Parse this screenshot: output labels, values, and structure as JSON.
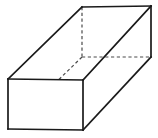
{
  "figure": {
    "name": "rectangular-prism",
    "background_color": "#ffffff",
    "solid_edge_color": "#1a1a1a",
    "hidden_edge_color": "#4a4a4a",
    "solid_edge_width": 1.7,
    "hidden_edge_width": 1.2,
    "hidden_dash_pattern": "3.2 2.6",
    "labels": [],
    "vertices": {
      "front_top_left": [
        8,
        79
      ],
      "front_top_right": [
        83,
        80
      ],
      "front_bottom_right": [
        83,
        130
      ],
      "front_bottom_left": [
        8,
        129
      ],
      "back_top_left": [
        82,
        7
      ],
      "back_top_right": [
        151,
        6
      ],
      "back_bottom_right": [
        151,
        57
      ],
      "back_bottom_left": [
        82,
        57
      ]
    },
    "faces": {
      "front": "8,79 83,80 83,130 8,129",
      "top": "8,79 82,7 151,6 83,80",
      "right": "83,80 151,6 151,57 83,130"
    },
    "edges_solid": [
      {
        "name": "front-top-edge",
        "from": [
          8,
          79
        ],
        "to": [
          83,
          80
        ]
      },
      {
        "name": "front-right-edge",
        "from": [
          83,
          80
        ],
        "to": [
          83,
          130
        ]
      },
      {
        "name": "front-bottom-edge",
        "from": [
          83,
          130
        ],
        "to": [
          8,
          129
        ]
      },
      {
        "name": "front-left-edge",
        "from": [
          8,
          129
        ],
        "to": [
          8,
          79
        ]
      },
      {
        "name": "top-left-receding-edge",
        "from": [
          8,
          79
        ],
        "to": [
          82,
          7
        ]
      },
      {
        "name": "top-back-edge",
        "from": [
          82,
          7
        ],
        "to": [
          151,
          6
        ]
      },
      {
        "name": "top-right-receding-edge",
        "from": [
          83,
          80
        ],
        "to": [
          151,
          6
        ]
      },
      {
        "name": "back-right-vertical-edge",
        "from": [
          151,
          6
        ],
        "to": [
          151,
          57
        ]
      },
      {
        "name": "bottom-right-receding-edge",
        "from": [
          83,
          130
        ],
        "to": [
          151,
          57
        ]
      }
    ],
    "edges_hidden": [
      {
        "name": "back-left-vertical-edge",
        "from": [
          82,
          7
        ],
        "to": [
          82,
          57
        ]
      },
      {
        "name": "back-bottom-edge",
        "from": [
          82,
          57
        ],
        "to": [
          151,
          57
        ]
      },
      {
        "name": "bottom-left-receding-edge",
        "from": [
          82,
          57
        ],
        "to": [
          8,
          129
        ]
      }
    ]
  }
}
